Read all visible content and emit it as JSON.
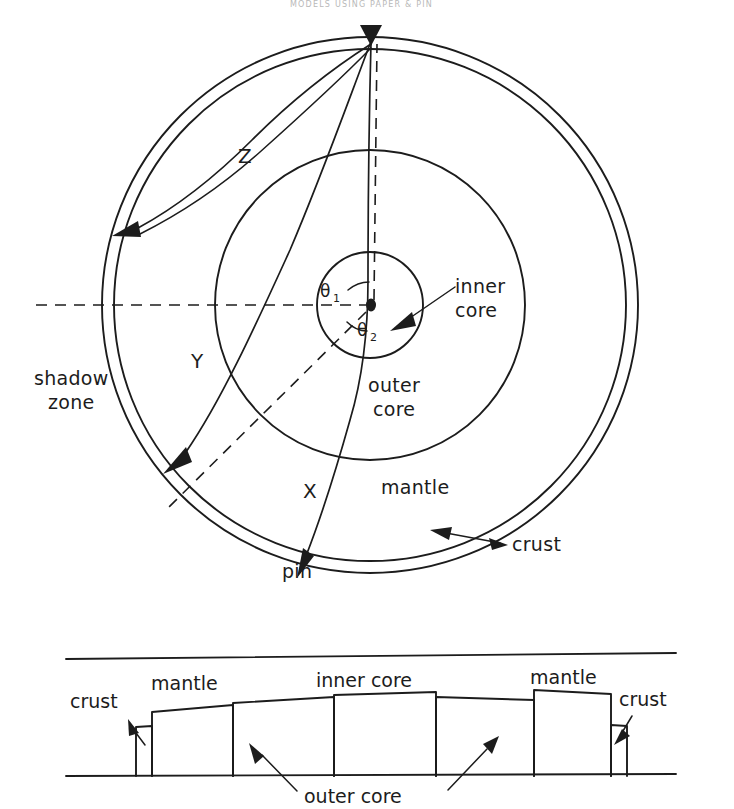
{
  "figure": {
    "header_note": "MODELS USING PAPER & PIN",
    "upper_diagram": {
      "name": "earth-cross-section-circular",
      "source_label": "pin-entry-point",
      "layers": [
        {
          "id": "crust",
          "label": "crust"
        },
        {
          "id": "mantle",
          "label": "mantle"
        },
        {
          "id": "outer-core",
          "label": "outer core"
        },
        {
          "id": "inner-core",
          "label": "inner core"
        }
      ],
      "rays": [
        {
          "id": "ray-z",
          "label": "Z"
        },
        {
          "id": "ray-y",
          "label": "Y"
        },
        {
          "id": "ray-x",
          "label": "X"
        }
      ],
      "angles": [
        {
          "id": "theta-1",
          "base": "θ",
          "sub": "1"
        },
        {
          "id": "theta-2",
          "base": "θ",
          "sub": "2"
        }
      ],
      "annotations": [
        {
          "id": "shadow-zone",
          "line1": "shadow",
          "line2": "zone"
        },
        {
          "id": "pin",
          "label": "pin"
        }
      ]
    },
    "lower_diagram": {
      "name": "unrolled-strip-cross-section",
      "blocks": [
        {
          "id": "crust-left",
          "label": "crust"
        },
        {
          "id": "mantle-left",
          "label": "mantle"
        },
        {
          "id": "outer-core-left",
          "label": "outer core"
        },
        {
          "id": "inner-core",
          "label": "inner core"
        },
        {
          "id": "mantle-right",
          "label": "mantle"
        },
        {
          "id": "crust-right",
          "label": "crust"
        }
      ],
      "labels": {
        "crust_left": "crust",
        "mantle_left": "mantle",
        "inner_core": "inner core",
        "mantle_right": "mantle",
        "crust_right": "crust",
        "outer_core": "outer core"
      }
    },
    "colors": {
      "ink": "#1c1c1c",
      "paper": "#ffffff",
      "faded_header": "#b9b9b9"
    }
  }
}
